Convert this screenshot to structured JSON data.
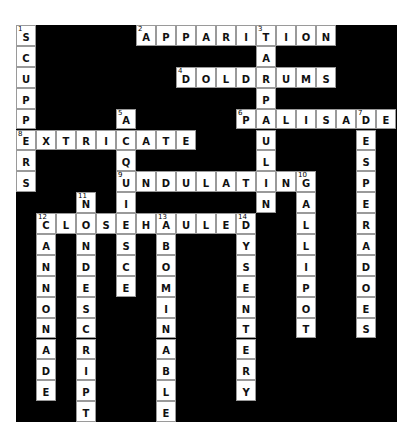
{
  "puzzle": {
    "cols": 19,
    "rows": 19,
    "colors": {
      "block": "#000000",
      "cell": "#ffffff",
      "border": "#9a9a9a",
      "text": "#111111"
    },
    "words": [
      {
        "number": 1,
        "direction": "down",
        "answer": "SCUPPERS",
        "col": 0,
        "row": 0
      },
      {
        "number": 2,
        "direction": "across",
        "answer": "APPARITION",
        "col": 6,
        "row": 0
      },
      {
        "number": 3,
        "direction": "down",
        "answer": "TARPAULIN",
        "col": 12,
        "row": 0
      },
      {
        "number": 4,
        "direction": "across",
        "answer": "DOLDRUMS",
        "col": 8,
        "row": 2
      },
      {
        "number": 5,
        "direction": "down",
        "answer": "ACQUIESCE",
        "col": 5,
        "row": 4
      },
      {
        "number": 6,
        "direction": "across",
        "answer": "PALISADE",
        "col": 11,
        "row": 4
      },
      {
        "number": 7,
        "direction": "down",
        "answer": "DESPERADOES",
        "col": 17,
        "row": 4
      },
      {
        "number": 8,
        "direction": "across",
        "answer": "EXTRICATE",
        "col": 0,
        "row": 5
      },
      {
        "number": 9,
        "direction": "across",
        "answer": "UNDULATING",
        "col": 5,
        "row": 7
      },
      {
        "number": 10,
        "direction": "down",
        "answer": "GALLIPOT",
        "col": 14,
        "row": 7
      },
      {
        "number": 11,
        "direction": "down",
        "answer": "NONDESCRIPT",
        "col": 3,
        "row": 8
      },
      {
        "number": 12,
        "direction": "across",
        "answer": "CLOSEHAULED",
        "col": 1,
        "row": 9
      },
      {
        "number": 12,
        "direction": "down",
        "answer": "CANNONADE",
        "col": 1,
        "row": 9
      },
      {
        "number": 13,
        "direction": "down",
        "answer": "ABOMINABLE",
        "col": 7,
        "row": 9
      },
      {
        "number": 14,
        "direction": "down",
        "answer": "DYSENTERY",
        "col": 11,
        "row": 9
      }
    ]
  }
}
